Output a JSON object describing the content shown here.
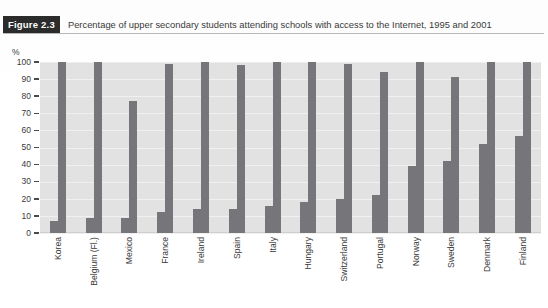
{
  "caption": {
    "tag": "Figure 2.3",
    "text": "Percentage of upper secondary students attending schools with access to the Internet, 1995 and 2001"
  },
  "axis": {
    "y_unit": "%",
    "y_ticks": [
      "100",
      "90",
      "80",
      "70",
      "60",
      "50",
      "40",
      "30",
      "20",
      "10",
      "0"
    ]
  },
  "chart_data": {
    "type": "bar",
    "title": "Percentage of upper secondary students attending schools with access to the Internet, 1995 and 2001",
    "xlabel": "",
    "ylabel": "%",
    "ylim": [
      0,
      100
    ],
    "grid": true,
    "legend_position": "none",
    "categories": [
      "Korea",
      "Belgium (Fl.)",
      "Mexico",
      "France",
      "Ireland",
      "Spain",
      "Italy",
      "Hungary",
      "Switzerland",
      "Portugal",
      "Norway",
      "Sweden",
      "Denmark",
      "Finland"
    ],
    "series": [
      {
        "name": "1995",
        "values": [
          7,
          9,
          9,
          12,
          14,
          14,
          16,
          18,
          20,
          22,
          39,
          42,
          52,
          57
        ]
      },
      {
        "name": "2001",
        "values": [
          100,
          100,
          77,
          99,
          100,
          98,
          100,
          100,
          99,
          94,
          100,
          91,
          100,
          100
        ]
      }
    ],
    "colors": {
      "bar": "#76767a",
      "plot_background": "#e2e2e2",
      "gridline": "#f0f0f0"
    }
  }
}
